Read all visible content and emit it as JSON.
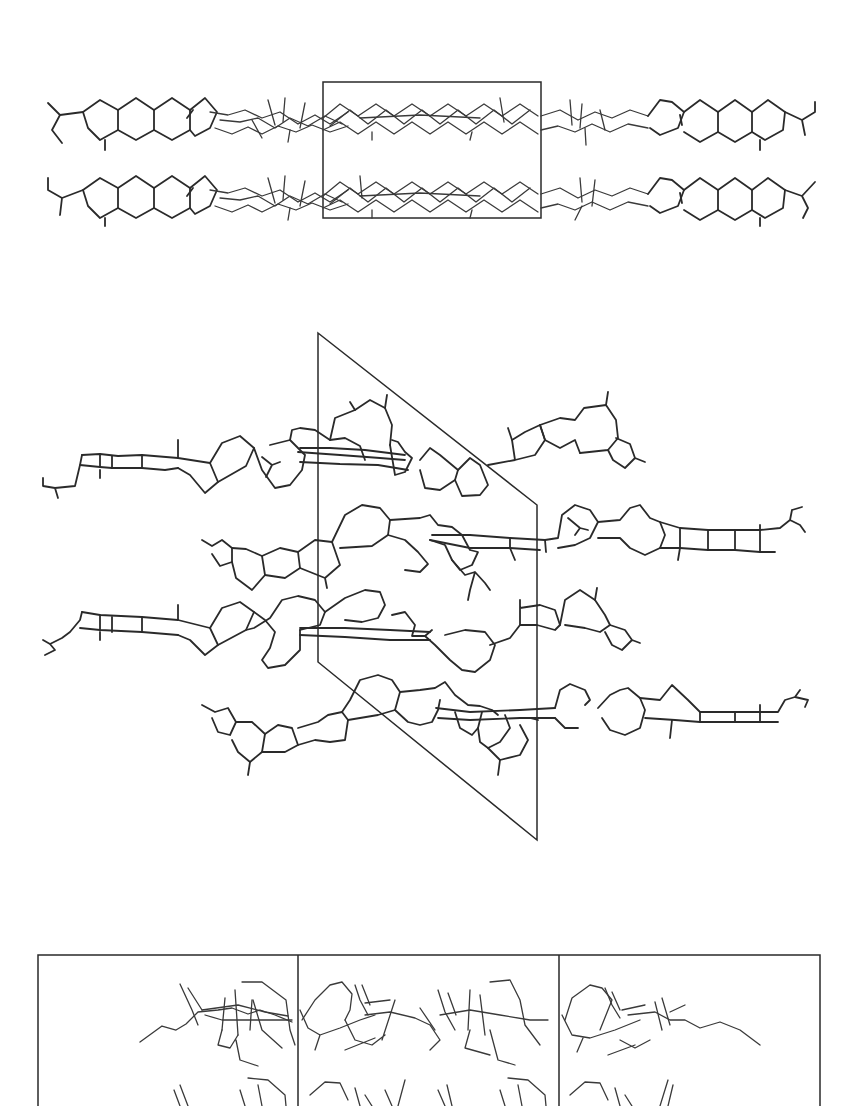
{
  "figure": {
    "background": "#ffffff",
    "line_color": "#2a2a2a",
    "panels": [
      {
        "id": "top",
        "description": "Crystal packing viewed along one axis: two parallel layers of steroid-like molecules, unit cell drawn as rectangle",
        "unit_cell": {
          "type": "rectangle",
          "x": 323,
          "y": 82,
          "width": 218,
          "height": 136
        },
        "rows": [
          {
            "y": 120,
            "hexagons_left_x": [
              108,
              146,
              183,
              220
            ],
            "hexagons_right_x": [
              650,
              688,
              726,
              765
            ]
          },
          {
            "y": 188,
            "hexagons_left_x": [
              108,
              146,
              183,
              220
            ],
            "hexagons_right_x": [
              650,
              688,
              726,
              765
            ]
          }
        ]
      },
      {
        "id": "middle",
        "description": "Crystal packing projection: four stacked molecular chains with fused rings, unit cell drawn as parallelogram",
        "unit_cell": {
          "type": "parallelogram",
          "points": [
            [
              318,
              333
            ],
            [
              537,
              505
            ],
            [
              537,
              840
            ],
            [
              318,
              662
            ]
          ]
        },
        "rows": [
          {
            "y": 460,
            "direction": "left-tail"
          },
          {
            "y": 535,
            "direction": "right-tail"
          },
          {
            "y": 630,
            "direction": "left-tail"
          },
          {
            "y": 705,
            "direction": "right-tail"
          }
        ]
      },
      {
        "id": "bottom",
        "description": "Crystal packing viewed end-on: three unit cells side by side with overlapping molecular projections",
        "unit_cell": {
          "type": "rectangle-strip",
          "x": 38,
          "y": 955,
          "width": 782,
          "dividers_x": [
            298,
            559
          ]
        },
        "cells": 3
      }
    ]
  }
}
